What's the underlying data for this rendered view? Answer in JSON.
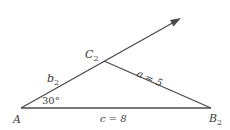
{
  "diagram": {
    "type": "triangle (SSA ambiguous case)",
    "colors": {
      "background": "#ffffff",
      "line": "#4a4a4a",
      "text": "#3a3a3a"
    },
    "vertices": {
      "A": {
        "label": "A",
        "x": 21,
        "y": 108
      },
      "B2": {
        "label": "B",
        "subscript": "2",
        "x": 211,
        "y": 108
      },
      "C2": {
        "label": "C",
        "subscript": "2",
        "x": 104,
        "y": 61
      }
    },
    "ray": {
      "from": "A",
      "through": "C2",
      "tip_x": 180,
      "tip_y": 19,
      "arrowhead": true
    },
    "sides": {
      "a": {
        "label": "a = 5",
        "between": [
          "C2",
          "B2"
        ]
      },
      "b2": {
        "label": "b",
        "subscript": "2",
        "between": [
          "A",
          "C2"
        ]
      },
      "c": {
        "label": "c = 8",
        "between": [
          "A",
          "B2"
        ]
      }
    },
    "angle_A": {
      "label": "30°",
      "value": 30
    }
  }
}
